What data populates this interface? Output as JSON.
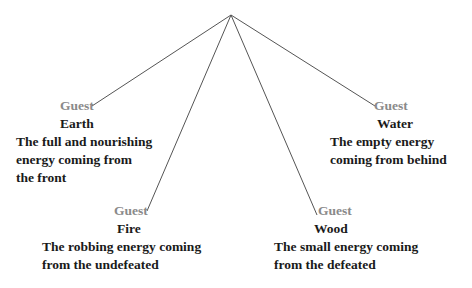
{
  "diagram": {
    "apex": {
      "x": 231,
      "y": 15
    },
    "line_color": "#555555",
    "nodes": [
      {
        "id": "earth",
        "role": "Guest",
        "element": "Earth",
        "description_lines": [
          "The full and nourishing",
          "energy coming from",
          "the front"
        ],
        "anchor": {
          "x": 92,
          "y": 106
        }
      },
      {
        "id": "water",
        "role": "Guest",
        "element": "Water",
        "description_lines": [
          "The empty energy",
          "coming from behind"
        ],
        "anchor": {
          "x": 375,
          "y": 106
        }
      },
      {
        "id": "fire",
        "role": "Guest",
        "element": "Fire",
        "description_lines": [
          "The robbing energy coming",
          "from the undefeated"
        ],
        "anchor": {
          "x": 147,
          "y": 211
        }
      },
      {
        "id": "wood",
        "role": "Guest",
        "element": "Wood",
        "description_lines": [
          "The small energy coming",
          "from the defeated"
        ],
        "anchor": {
          "x": 317,
          "y": 215
        }
      }
    ]
  }
}
